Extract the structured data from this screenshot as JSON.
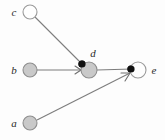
{
  "diagram": {
    "canvas": {
      "width": 165,
      "height": 140,
      "background": "#fdfdfd"
    },
    "colors": {
      "edge": "#7d7d7d",
      "node_fill_gray": "#c9c9c9",
      "node_fill_white": "#fefefe",
      "node_stroke": "#9a9a9a",
      "endpoint_dot": "#111111",
      "label_text": "#2b2b2b"
    },
    "nodes": [
      {
        "id": "c",
        "label": "c",
        "cx": 30,
        "cy": 12,
        "r": 7,
        "style": "open",
        "label_x": 14,
        "label_y": 16,
        "label_anchor": "middle"
      },
      {
        "id": "b",
        "label": "b",
        "cx": 30,
        "cy": 70,
        "r": 7,
        "style": "filled",
        "label_x": 14,
        "label_y": 74,
        "label_anchor": "middle"
      },
      {
        "id": "a",
        "label": "a",
        "cx": 30,
        "cy": 123,
        "r": 7,
        "style": "filled",
        "label_x": 14,
        "label_y": 127,
        "label_anchor": "middle"
      },
      {
        "id": "d",
        "label": "d",
        "cx": 89,
        "cy": 70,
        "r": 8,
        "style": "filled",
        "label_x": 93,
        "label_y": 57,
        "label_anchor": "middle"
      },
      {
        "id": "e",
        "label": "e",
        "cx": 138,
        "cy": 70,
        "r": 8,
        "style": "open",
        "label_x": 154,
        "label_y": 74,
        "label_anchor": "middle"
      }
    ],
    "edges": [
      {
        "id": "c-to-d",
        "from": "c",
        "to": "d",
        "x1": 35,
        "y1": 17,
        "x2": 83,
        "y2": 65,
        "head": "dot",
        "dot_x": 82,
        "dot_y": 64,
        "dot_r": 3.6
      },
      {
        "id": "b-to-d",
        "from": "b",
        "to": "d",
        "x1": 37,
        "y1": 70,
        "x2": 81,
        "y2": 70,
        "head": "arrow",
        "arrow_points": "75,66 81,70 75,74"
      },
      {
        "id": "d-to-e",
        "from": "d",
        "to": "e",
        "x1": 97,
        "y1": 70,
        "x2": 132,
        "y2": 69,
        "head": "dot",
        "dot_x": 131,
        "dot_y": 69,
        "dot_r": 3.6
      },
      {
        "id": "a-to-e",
        "from": "a",
        "to": "e",
        "x1": 37,
        "y1": 120,
        "x2": 130,
        "y2": 73,
        "head": "arrow",
        "arrow_points": "121,73 130,73 125,81"
      }
    ]
  }
}
